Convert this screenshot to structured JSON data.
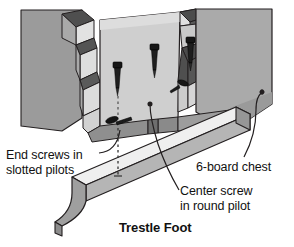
{
  "figure": {
    "type": "technical-illustration",
    "title": "Trestle Foot",
    "background_color": "#ffffff",
    "palette": {
      "line": "#231f20",
      "chest_side_dark": "#9a9a9a",
      "chest_front_light": "#d5d5d5",
      "chest_front_mid": "#c2c2c2",
      "dovetail_light": "#e4e4e4",
      "dovetail_shadow": "#585858",
      "foot_top": "#efefef",
      "foot_face": "#b3b3b3",
      "foot_end": "#8e8e8e",
      "screw_body": "#1a1a1a",
      "screw_shadow": "#555555",
      "text": "#111111"
    }
  },
  "labels": {
    "end_screws": {
      "line1": "End screws in",
      "line2": "slotted pilots"
    },
    "six_board_chest": {
      "line1": "6-board chest"
    },
    "center_screw": {
      "line1": "Center screw",
      "line2": "in round pilot"
    },
    "title": "Trestle Foot"
  },
  "parts": {
    "screws": [
      {
        "name": "left-end-screw-vertical",
        "x": 118,
        "y": 62
      },
      {
        "name": "center-screw-vertical",
        "x": 155,
        "y": 45
      },
      {
        "name": "right-end-screw-vertical",
        "x": 190,
        "y": 38
      },
      {
        "name": "left-end-screw-installed",
        "x": 118,
        "y": 124
      }
    ],
    "leaders": [
      {
        "name": "leader-end-screws",
        "from": "End screws in slotted pilots",
        "to": "installed end screw"
      },
      {
        "name": "leader-center-screw",
        "from": "Center screw in round pilot",
        "to": "center pilot hole"
      },
      {
        "name": "leader-six-board-chest",
        "from": "6-board chest",
        "to": "chest lower right corner"
      }
    ],
    "dashed_guide": {
      "name": "screw-alignment-dashes",
      "x": 118,
      "y_top": 94,
      "y_bottom": 178
    }
  }
}
